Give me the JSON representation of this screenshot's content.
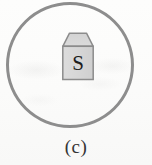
{
  "figure": {
    "caption": "(c)",
    "kind": "diagram",
    "colors": {
      "background": "#fbfbfa",
      "circle_stroke": "#8d8d8d",
      "icon_fill": "#d9d9d9",
      "icon_fill_top": "#cfcfcf",
      "icon_stroke": "#8c8c8c",
      "letter_color": "#1d1d1d",
      "caption_color": "#343434"
    },
    "circle": {
      "name": "outer-circle",
      "stroke_width_px": 3,
      "diameter_px": 128
    },
    "icon": {
      "name": "carton-icon",
      "shape": "pentagon-carton",
      "label": "S",
      "width_px": 34,
      "height_px": 50
    }
  }
}
